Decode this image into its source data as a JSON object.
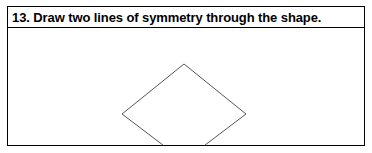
{
  "worksheet": {
    "question_number": "13.",
    "question_text": "13. Draw two lines of symmetry through the shape.",
    "instruction_verb": "Draw",
    "lines_required": 2
  },
  "colors": {
    "border": "#000000",
    "text": "#000000",
    "page_background": "#ffffff",
    "box_background": "#ffffff",
    "shape_stroke": "#555555",
    "shape_fill": "#ffffff"
  },
  "shape": {
    "name": "rhombus",
    "label": "diamond",
    "sides": 4,
    "fill": "none",
    "stroke_width": 1,
    "lines_of_symmetry_drawn": 0,
    "vertices": [
      {
        "name": "top",
        "x": 176,
        "y": 36
      },
      {
        "name": "right",
        "x": 238,
        "y": 86
      },
      {
        "name": "bottom",
        "x": 176,
        "y": 133
      },
      {
        "name": "left",
        "x": 114,
        "y": 86
      }
    ],
    "points_attr": "176,36 238,86 176,133 114,86"
  }
}
